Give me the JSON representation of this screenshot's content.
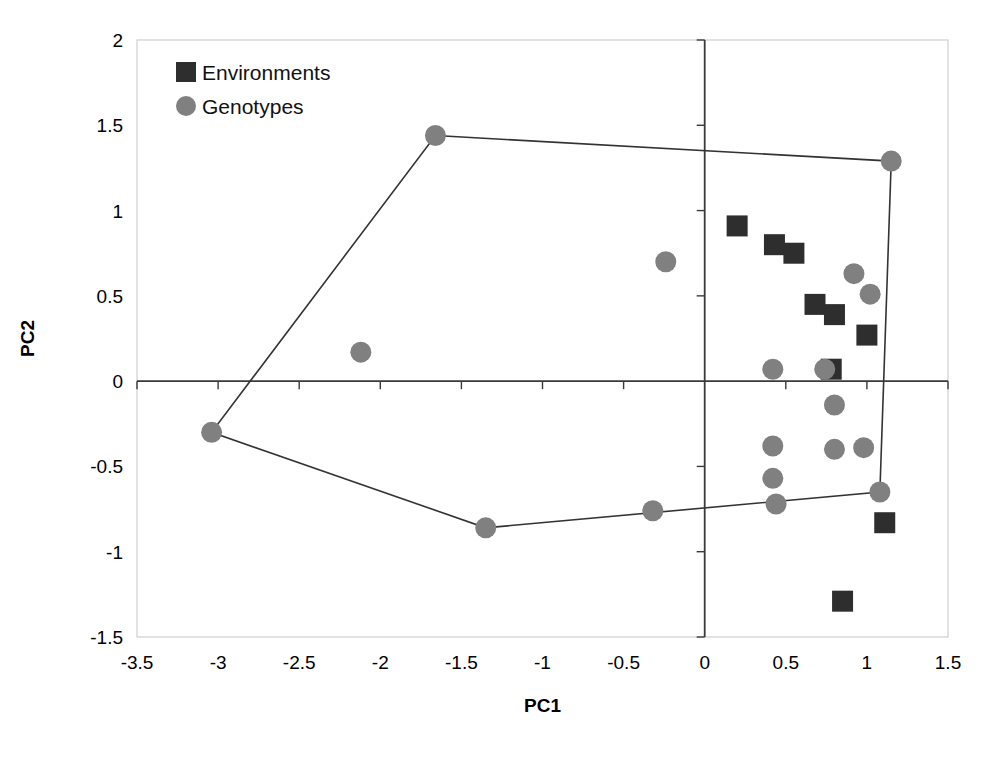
{
  "chart_data": {
    "type": "scatter",
    "title": "",
    "xlabel": "PC1",
    "ylabel": "PC2",
    "xlim": [
      -3.5,
      1.5
    ],
    "ylim": [
      -1.5,
      2
    ],
    "xticks": [
      "-3.5",
      "-3",
      "-2.5",
      "-2",
      "-1.5",
      "-1",
      "-0.5",
      "0",
      "0.5",
      "1",
      "1.5"
    ],
    "xtick_values": [
      -3.5,
      -3,
      -2.5,
      -2,
      -1.5,
      -1,
      -0.5,
      0,
      0.5,
      1,
      1.5
    ],
    "yticks": [
      "2",
      "1.5",
      "1",
      "0.5",
      "0",
      "-0.5",
      "-1",
      "-1.5"
    ],
    "ytick_values": [
      2,
      1.5,
      1,
      0.5,
      0,
      -0.5,
      -1,
      -1.5
    ],
    "grid": false,
    "legend_position": "top-left",
    "series": [
      {
        "name": "Environments",
        "marker": "square",
        "color": "#2e2e2e",
        "points": [
          {
            "x": 0.2,
            "y": 0.91
          },
          {
            "x": 0.43,
            "y": 0.8
          },
          {
            "x": 0.55,
            "y": 0.75
          },
          {
            "x": 0.68,
            "y": 0.45
          },
          {
            "x": 0.8,
            "y": 0.39
          },
          {
            "x": 1.0,
            "y": 0.27
          },
          {
            "x": 0.78,
            "y": 0.07
          },
          {
            "x": 1.11,
            "y": -0.83
          },
          {
            "x": 0.85,
            "y": -1.29
          }
        ]
      },
      {
        "name": "Genotypes",
        "marker": "circle",
        "color": "#808080",
        "points": [
          {
            "x": -1.66,
            "y": 1.44
          },
          {
            "x": 1.15,
            "y": 1.29
          },
          {
            "x": -0.24,
            "y": 0.7
          },
          {
            "x": 0.92,
            "y": 0.63
          },
          {
            "x": 1.02,
            "y": 0.51
          },
          {
            "x": -2.12,
            "y": 0.17
          },
          {
            "x": 0.42,
            "y": 0.07
          },
          {
            "x": 0.74,
            "y": 0.07
          },
          {
            "x": 0.8,
            "y": -0.14
          },
          {
            "x": 0.42,
            "y": -0.38
          },
          {
            "x": 0.8,
            "y": -0.4
          },
          {
            "x": 0.98,
            "y": -0.39
          },
          {
            "x": 0.42,
            "y": -0.57
          },
          {
            "x": -3.04,
            "y": -0.3
          },
          {
            "x": 0.44,
            "y": -0.72
          },
          {
            "x": -0.32,
            "y": -0.76
          },
          {
            "x": -1.35,
            "y": -0.86
          },
          {
            "x": 1.08,
            "y": -0.65
          }
        ]
      }
    ],
    "hull": {
      "name": "convex-hull-polygon",
      "color": "#333333",
      "vertices": [
        {
          "x": -1.66,
          "y": 1.44
        },
        {
          "x": 1.15,
          "y": 1.29
        },
        {
          "x": 1.08,
          "y": -0.65
        },
        {
          "x": -1.35,
          "y": -0.86
        },
        {
          "x": -3.04,
          "y": -0.3
        }
      ]
    }
  },
  "legend": {
    "items": [
      {
        "label": "Environments",
        "marker": "square",
        "color": "#2e2e2e"
      },
      {
        "label": "Genotypes",
        "marker": "circle",
        "color": "#808080"
      }
    ]
  }
}
